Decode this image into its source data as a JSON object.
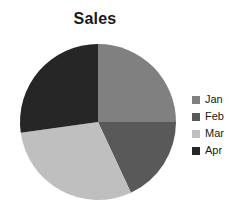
{
  "chart_data": {
    "type": "pie",
    "title": "Sales",
    "categories": [
      "Jan",
      "Feb",
      "Mar",
      "Apr"
    ],
    "values": [
      25,
      18,
      30,
      27
    ],
    "unit": "percent",
    "start_angle_deg": 0,
    "direction": "clockwise",
    "slice_angles_deg": [
      90,
      65,
      107,
      98
    ],
    "colors": [
      "#808080",
      "#595959",
      "#bfbfbf",
      "#262626"
    ],
    "legend": {
      "position": "right",
      "entries": [
        {
          "label": "Jan",
          "color": "#808080"
        },
        {
          "label": "Feb",
          "color": "#595959"
        },
        {
          "label": "Mar",
          "color": "#bfbfbf"
        },
        {
          "label": "Apr",
          "color": "#262626"
        }
      ]
    },
    "xlabel": "",
    "ylabel": "",
    "grid": false,
    "data_labels": false
  },
  "geometry": {
    "center_x": 98,
    "center_y": 122,
    "radius": 78
  }
}
